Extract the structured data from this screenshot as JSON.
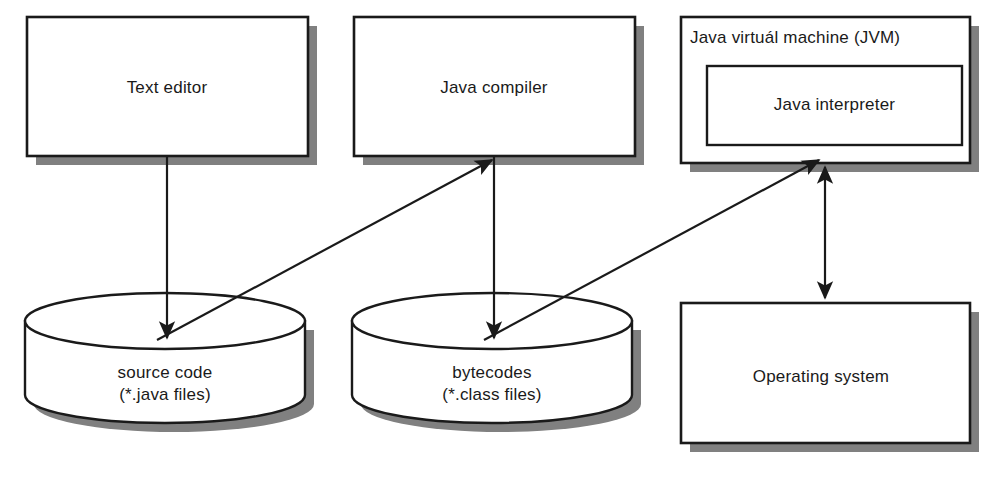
{
  "diagram": {
    "colors": {
      "stroke": "#1a1a1a",
      "shadow": "#808080",
      "fill": "#ffffff",
      "text": "#1a1a1a"
    },
    "nodes": [
      {
        "id": "text-editor",
        "shape": "rectangle",
        "label": "Text editor"
      },
      {
        "id": "java-compiler",
        "shape": "rectangle",
        "label": "Java compiler"
      },
      {
        "id": "jvm",
        "shape": "rectangle",
        "label": "Java virtuál machine (JVM)"
      },
      {
        "id": "java-interpreter",
        "shape": "rectangle",
        "label": "Java interpreter"
      },
      {
        "id": "source-code",
        "shape": "cylinder",
        "label": "source code\n(*.java files)"
      },
      {
        "id": "bytecodes",
        "shape": "cylinder",
        "label": "bytecodes\n(*.class files)"
      },
      {
        "id": "operating-system",
        "shape": "rectangle",
        "label": "Operating system"
      }
    ],
    "edges": [
      {
        "id": "text-editor-to-source-code",
        "from": "text-editor",
        "to": "source-code",
        "direction": "forward"
      },
      {
        "id": "source-code-to-java-compiler",
        "from": "source-code",
        "to": "java-compiler",
        "direction": "forward"
      },
      {
        "id": "java-compiler-to-bytecodes",
        "from": "java-compiler",
        "to": "bytecodes",
        "direction": "forward"
      },
      {
        "id": "bytecodes-to-jvm",
        "from": "bytecodes",
        "to": "jvm",
        "direction": "forward"
      },
      {
        "id": "jvm-to-operating-system",
        "from": "jvm",
        "to": "operating-system",
        "direction": "bidirectional"
      }
    ]
  }
}
